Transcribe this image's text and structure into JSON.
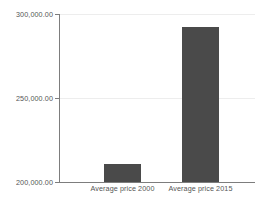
{
  "chart_data": {
    "type": "bar",
    "title": "",
    "subtitle": "",
    "xlabel": "",
    "ylabel": "",
    "categories": [
      "Average price 2000",
      "Average price 2015"
    ],
    "values": [
      211000,
      292000
    ],
    "series": [
      {
        "name": "Average price",
        "values": [
          211000,
          292000
        ]
      }
    ],
    "ylim": [
      200000,
      300000
    ],
    "y_ticks": [
      200000,
      250000,
      300000
    ],
    "y_tick_labels": [
      "200,000.00",
      "250,000.00",
      "300,000.00"
    ],
    "grid": true,
    "legend": false,
    "legend_position": "none",
    "bar_color": "#4a4a4a",
    "axis_color": "#7d7d7d",
    "gridline_color": "#ededed",
    "text_color": "#555555",
    "background_color": "#ffffff",
    "annotations": []
  },
  "axis": {
    "y_tick_300": "300,000.00",
    "y_tick_250": "250,000.00",
    "y_tick_200": "200,000.00"
  },
  "categories": {
    "cat_0": "Average price 2000",
    "cat_1": "Average price 2015"
  }
}
